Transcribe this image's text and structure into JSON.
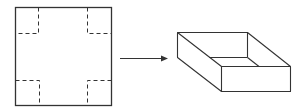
{
  "diagram": {
    "stroke_color": "#333333",
    "background": "#ffffff",
    "flat_sheet": {
      "outline": {
        "x": 15,
        "y": 7,
        "width": 96,
        "height": 98
      },
      "corner_squares": [
        {
          "corner": "top-left",
          "fold_x": 38,
          "fold_y": 33
        },
        {
          "corner": "top-right",
          "fold_x": 87,
          "fold_y": 33
        },
        {
          "corner": "bottom-left",
          "fold_x": 39,
          "fold_y": 80
        },
        {
          "corner": "bottom-right",
          "fold_x": 87,
          "fold_y": 80
        }
      ],
      "line_style": "dashed"
    },
    "arrow": {
      "x1": 120,
      "y1": 58,
      "x2": 167,
      "y2": 58,
      "direction": "right"
    },
    "box": {
      "type": "open-top rectangular tray",
      "vertices": {
        "top_back_left": [
          177,
          32
        ],
        "top_back_right": [
          247,
          32
        ],
        "top_front_left": [
          221,
          66
        ],
        "top_front_right": [
          290,
          66
        ],
        "bottom_back_left": [
          177,
          57
        ],
        "bottom_front_left": [
          221,
          91
        ],
        "bottom_front_right": [
          290,
          91
        ],
        "inner_floor_back_left": [
          209,
          57
        ],
        "inner_floor_back_right": [
          247,
          57
        ],
        "inner_floor_front_right": [
          259,
          66
        ]
      }
    }
  }
}
